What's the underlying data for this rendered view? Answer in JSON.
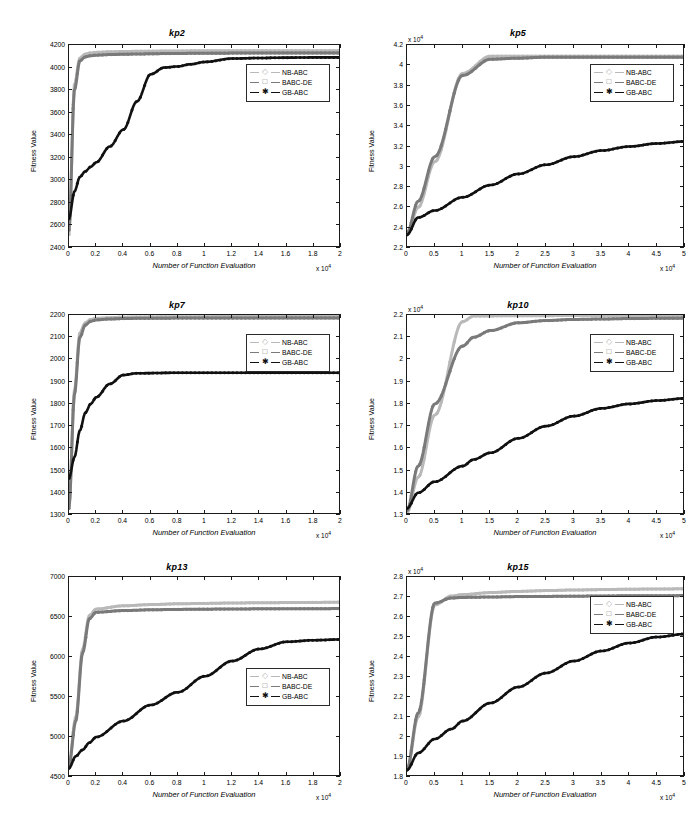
{
  "figure": {
    "layout": "3 rows x 2 columns of line charts",
    "series_names": [
      "NB-ABC",
      "BABC-DE",
      "GB-ABC"
    ],
    "series_colors": [
      "#b9b9b9",
      "#7a7a7a",
      "#111111"
    ],
    "series_markers": [
      "diamond",
      "square",
      "asterisk"
    ],
    "axis_label_x": "Number of Function Evaluation",
    "axis_label_y": "Fitness Value",
    "exponent_label": "x 10",
    "exponent_power": "4"
  },
  "chart_data": [
    {
      "type": "line",
      "title": "kp2",
      "xlabel": "Number of Function Evaluation",
      "ylabel": "Fitness Value",
      "xlim": [
        0,
        2
      ],
      "ylim": [
        2400,
        4200
      ],
      "xticks": [
        "0",
        "0.2",
        "0.4",
        "0.6",
        "0.8",
        "1",
        "1.2",
        "1.4",
        "1.6",
        "1.8",
        "2"
      ],
      "yticks": [
        "2400",
        "2600",
        "2800",
        "3000",
        "3200",
        "3400",
        "3600",
        "3800",
        "4000",
        "4200"
      ],
      "x_exponent": "x 10",
      "x_exponent_power": "4",
      "y_exponent": "",
      "grid": false,
      "legend_position": "right-upper",
      "x": [
        0,
        0.04,
        0.08,
        0.12,
        0.16,
        0.2,
        0.3,
        0.4,
        0.5,
        0.6,
        0.7,
        0.8,
        0.9,
        1.0,
        1.2,
        1.4,
        1.6,
        1.8,
        2.0
      ],
      "series": [
        {
          "name": "NB-ABC",
          "values": [
            2520,
            3850,
            4085,
            4120,
            4130,
            4135,
            4140,
            4142,
            4144,
            4145,
            4146,
            4147,
            4148,
            4148,
            4149,
            4150,
            4150,
            4150,
            4150
          ]
        },
        {
          "name": "BABC-DE",
          "values": [
            2560,
            3800,
            4060,
            4095,
            4105,
            4110,
            4115,
            4118,
            4120,
            4122,
            4124,
            4125,
            4126,
            4127,
            4128,
            4129,
            4130,
            4130,
            4130
          ]
        },
        {
          "name": "GB-ABC",
          "values": [
            2660,
            2900,
            3030,
            3080,
            3120,
            3160,
            3300,
            3450,
            3700,
            3940,
            4000,
            4010,
            4030,
            4050,
            4080,
            4085,
            4088,
            4090,
            4090
          ]
        }
      ]
    },
    {
      "type": "line",
      "title": "kp5",
      "xlabel": "Number of Function Evaluation",
      "ylabel": "Fitness Value",
      "xlim": [
        0,
        5
      ],
      "ylim": [
        2.2,
        4.2
      ],
      "xticks": [
        "0",
        "0.5",
        "1",
        "1.5",
        "2",
        "2.5",
        "3",
        "3.5",
        "4",
        "4.5",
        "5"
      ],
      "yticks": [
        "2.2",
        "2.4",
        "2.6",
        "2.8",
        "3",
        "3.2",
        "3.4",
        "3.6",
        "3.8",
        "4",
        "4.2"
      ],
      "x_exponent": "x 10",
      "x_exponent_power": "4",
      "y_exponent": "x 10",
      "y_exponent_power": "4",
      "grid": false,
      "legend_position": "right-upper",
      "x": [
        0,
        0.2,
        0.5,
        1.0,
        1.5,
        2.0,
        2.5,
        3.0,
        3.5,
        4.0,
        4.5,
        5.0
      ],
      "series": [
        {
          "name": "NB-ABC",
          "values": [
            2.33,
            2.6,
            3.05,
            3.92,
            4.09,
            4.09,
            4.09,
            4.09,
            4.09,
            4.09,
            4.09,
            4.09
          ]
        },
        {
          "name": "BABC-DE",
          "values": [
            2.35,
            2.66,
            3.1,
            3.9,
            4.06,
            4.07,
            4.08,
            4.08,
            4.08,
            4.08,
            4.08,
            4.08
          ]
        },
        {
          "name": "GB-ABC",
          "values": [
            2.33,
            2.5,
            2.57,
            2.7,
            2.82,
            2.93,
            3.02,
            3.1,
            3.16,
            3.2,
            3.23,
            3.25
          ]
        }
      ]
    },
    {
      "type": "line",
      "title": "kp7",
      "xlabel": "Number of Function Evaluation",
      "ylabel": "Fitness Value",
      "xlim": [
        0,
        2
      ],
      "ylim": [
        1300,
        2200
      ],
      "xticks": [
        "0",
        "0.2",
        "0.4",
        "0.6",
        "0.8",
        "1",
        "1.2",
        "1.4",
        "1.6",
        "1.8",
        "2"
      ],
      "yticks": [
        "1300",
        "1400",
        "1500",
        "1600",
        "1700",
        "1800",
        "1900",
        "2000",
        "2100",
        "2200"
      ],
      "x_exponent": "x 10",
      "x_exponent_power": "4",
      "y_exponent": "",
      "grid": false,
      "legend_position": "right-upper",
      "x": [
        0,
        0.04,
        0.08,
        0.12,
        0.16,
        0.2,
        0.3,
        0.4,
        0.5,
        0.8,
        1.2,
        1.6,
        2.0
      ],
      "series": [
        {
          "name": "NB-ABC",
          "values": [
            1340,
            1860,
            2120,
            2165,
            2180,
            2185,
            2188,
            2190,
            2191,
            2192,
            2193,
            2193,
            2193
          ]
        },
        {
          "name": "BABC-DE",
          "values": [
            1330,
            1840,
            2100,
            2155,
            2172,
            2178,
            2182,
            2184,
            2185,
            2186,
            2186,
            2187,
            2187
          ]
        },
        {
          "name": "GB-ABC",
          "values": [
            1465,
            1560,
            1680,
            1760,
            1800,
            1830,
            1890,
            1930,
            1938,
            1940,
            1940,
            1940,
            1940
          ]
        }
      ]
    },
    {
      "type": "line",
      "title": "kp10",
      "xlabel": "Number of Function Evaluation",
      "ylabel": "Fitness Value",
      "xlim": [
        0,
        5
      ],
      "ylim": [
        1.3,
        2.2
      ],
      "xticks": [
        "0",
        "0.5",
        "1",
        "1.5",
        "2",
        "2.5",
        "3",
        "3.5",
        "4",
        "4.5",
        "5"
      ],
      "yticks": [
        "1.3",
        "1.4",
        "1.5",
        "1.6",
        "1.7",
        "1.8",
        "1.9",
        "2",
        "2.1",
        "2.2"
      ],
      "x_exponent": "x 10",
      "x_exponent_power": "4",
      "y_exponent": "x 10",
      "y_exponent_power": "4",
      "grid": false,
      "legend_position": "right-upper",
      "x": [
        0,
        0.2,
        0.5,
        1.0,
        1.2,
        1.5,
        2.0,
        2.5,
        3.0,
        3.5,
        4.0,
        4.5,
        5.0
      ],
      "series": [
        {
          "name": "NB-ABC",
          "values": [
            1.31,
            1.47,
            1.75,
            2.17,
            2.195,
            2.196,
            2.197,
            2.197,
            2.198,
            2.198,
            2.198,
            2.198,
            2.198
          ]
        },
        {
          "name": "BABC-DE",
          "values": [
            1.32,
            1.52,
            1.8,
            2.06,
            2.1,
            2.13,
            2.165,
            2.175,
            2.18,
            2.182,
            2.184,
            2.185,
            2.186
          ]
        },
        {
          "name": "GB-ABC",
          "values": [
            1.33,
            1.4,
            1.45,
            1.52,
            1.55,
            1.58,
            1.645,
            1.7,
            1.745,
            1.78,
            1.8,
            1.815,
            1.825
          ]
        }
      ]
    },
    {
      "type": "line",
      "title": "kp13",
      "xlabel": "Number of Function Evaluation",
      "ylabel": "Fitness Value",
      "xlim": [
        0,
        2
      ],
      "ylim": [
        4500,
        7000
      ],
      "xticks": [
        "0",
        "0.2",
        "0.4",
        "0.6",
        "0.8",
        "1",
        "1.2",
        "1.4",
        "1.6",
        "1.8",
        "2"
      ],
      "yticks": [
        "4500",
        "5000",
        "5500",
        "6000",
        "6500",
        "7000"
      ],
      "x_exponent": "x 10",
      "x_exponent_power": "4",
      "y_exponent": "",
      "grid": false,
      "legend_position": "right-lower",
      "x": [
        0,
        0.05,
        0.1,
        0.15,
        0.2,
        0.4,
        0.6,
        0.8,
        1.0,
        1.2,
        1.4,
        1.6,
        1.8,
        2.0
      ],
      "series": [
        {
          "name": "NB-ABC",
          "values": [
            4660,
            5250,
            6100,
            6520,
            6600,
            6640,
            6655,
            6665,
            6670,
            6675,
            6678,
            6680,
            6682,
            6685
          ]
        },
        {
          "name": "BABC-DE",
          "values": [
            4650,
            5200,
            6050,
            6480,
            6560,
            6580,
            6590,
            6595,
            6598,
            6600,
            6602,
            6603,
            6604,
            6605
          ]
        },
        {
          "name": "GB-ABC",
          "values": [
            4610,
            4760,
            4840,
            4930,
            5000,
            5200,
            5400,
            5560,
            5760,
            5950,
            6100,
            6190,
            6210,
            6220
          ]
        }
      ]
    },
    {
      "type": "line",
      "title": "kp15",
      "xlabel": "Number of Function Evaluation",
      "ylabel": "Fitness Value",
      "xlim": [
        0,
        5
      ],
      "ylim": [
        1.8,
        2.8
      ],
      "xticks": [
        "0",
        "0.5",
        "1",
        "1.5",
        "2",
        "2.5",
        "3",
        "3.5",
        "4",
        "4.5",
        "5"
      ],
      "yticks": [
        "1.8",
        "1.9",
        "2",
        "2.1",
        "2.2",
        "2.3",
        "2.4",
        "2.5",
        "2.6",
        "2.7",
        "2.8"
      ],
      "x_exponent": "x 10",
      "x_exponent_power": "4",
      "y_exponent": "x 10",
      "y_exponent_power": "4",
      "grid": false,
      "legend_position": "right-upper",
      "x": [
        0,
        0.2,
        0.5,
        0.8,
        1.0,
        1.5,
        2.0,
        2.5,
        3.0,
        3.5,
        4.0,
        4.5,
        5.0
      ],
      "series": [
        {
          "name": "NB-ABC",
          "values": [
            1.835,
            2.1,
            2.66,
            2.705,
            2.712,
            2.722,
            2.728,
            2.732,
            2.735,
            2.737,
            2.739,
            2.74,
            2.741
          ]
        },
        {
          "name": "BABC-DE",
          "values": [
            1.84,
            2.12,
            2.67,
            2.695,
            2.698,
            2.7,
            2.702,
            2.703,
            2.704,
            2.705,
            2.706,
            2.706,
            2.707
          ]
        },
        {
          "name": "GB-ABC",
          "values": [
            1.835,
            1.92,
            1.99,
            2.04,
            2.08,
            2.17,
            2.25,
            2.32,
            2.38,
            2.43,
            2.47,
            2.5,
            2.515
          ]
        }
      ]
    }
  ],
  "legend": {
    "entries": [
      {
        "label": "NB-ABC",
        "marker": "◇",
        "color": "#b9b9b9"
      },
      {
        "label": "BABC-DE",
        "marker": "□",
        "color": "#7a7a7a"
      },
      {
        "label": "GB-ABC",
        "marker": "✱",
        "color": "#111111"
      }
    ]
  }
}
